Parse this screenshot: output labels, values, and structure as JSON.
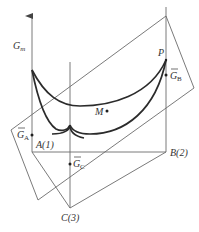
{
  "diagram": {
    "type": "ternary-gibbs-energy-surface",
    "axis_label": {
      "main": "G",
      "subscript": "m"
    },
    "vertices": [
      {
        "id": "A",
        "label": "A(1)"
      },
      {
        "id": "B",
        "label": "B(2)"
      },
      {
        "id": "C",
        "label": "C(3)"
      }
    ],
    "partial_molar_labels": [
      {
        "id": "GA",
        "main": "G",
        "subscript": "A",
        "overbar": true
      },
      {
        "id": "GB",
        "main": "G",
        "subscript": "B",
        "overbar": true
      },
      {
        "id": "GC",
        "main": "G",
        "subscript": "C",
        "overbar": true
      }
    ],
    "points": [
      {
        "id": "M",
        "label": "M"
      },
      {
        "id": "P",
        "label": "P"
      }
    ],
    "colors": {
      "curve": "#2b2b2b",
      "lines": "#6b6b6b",
      "text": "#333333",
      "background": "#ffffff"
    }
  }
}
